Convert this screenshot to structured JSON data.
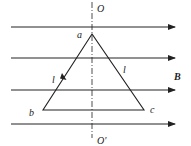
{
  "diagram": {
    "labels": {
      "axis_top": "O",
      "axis_bottom": "O'",
      "vertex_a": "a",
      "vertex_b": "b",
      "vertex_c": "c",
      "side_left": "l",
      "side_right": "l",
      "field": "B"
    },
    "field_lines": [
      {
        "y": 27
      },
      {
        "y": 58
      },
      {
        "y": 90
      },
      {
        "y": 124
      }
    ],
    "field_line_x_start": 11,
    "field_line_x_end": 175,
    "axis": {
      "x": 92,
      "y_start": 0,
      "y_end": 140
    },
    "triangle": {
      "a": [
        92,
        34
      ],
      "b": [
        43,
        110
      ],
      "c": [
        144,
        110
      ]
    },
    "colors": {
      "stroke": "#222222",
      "background": "#ffffff"
    }
  }
}
